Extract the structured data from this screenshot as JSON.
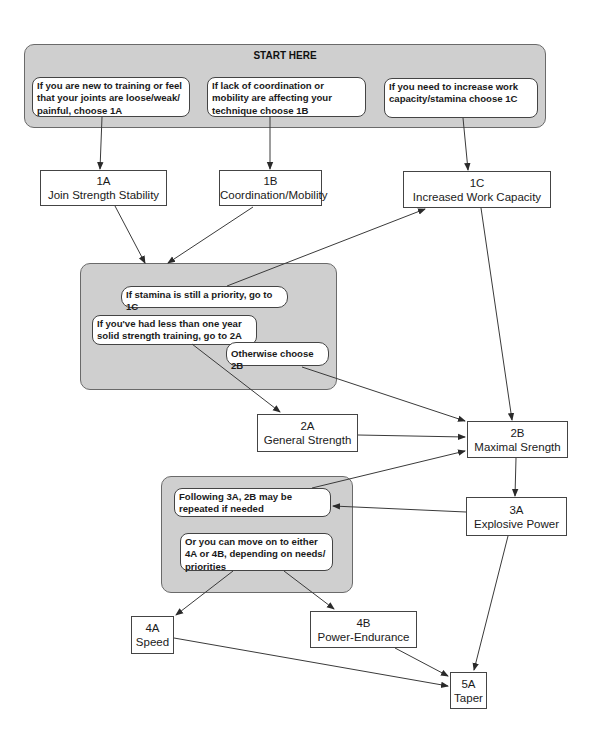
{
  "start_group": {
    "title": "START HERE",
    "notes": [
      {
        "text": "If you are new to training or feel that your joints are loose/weak/ painful, choose 1A"
      },
      {
        "text": "If lack of coordination or mobility are affecting your technique choose 1B"
      },
      {
        "text": "If you need to increase work capacity/stamina choose 1C"
      }
    ]
  },
  "nodes": {
    "n1a": {
      "code": "1A",
      "label": "Join Strength Stability"
    },
    "n1b": {
      "code": "1B",
      "label": "Coordination/Mobility"
    },
    "n1c": {
      "code": "1C",
      "label": "Increased Work Capacity"
    },
    "n2a": {
      "code": "2A",
      "label": "General Strength"
    },
    "n2b": {
      "code": "2B",
      "label": "Maximal Srength"
    },
    "n3a": {
      "code": "3A",
      "label": "Explosive Power"
    },
    "n4a": {
      "code": "4A",
      "label": "Speed"
    },
    "n4b": {
      "code": "4B",
      "label": "Power-Endurance"
    },
    "n5a": {
      "code": "5A",
      "label": "Taper"
    }
  },
  "phase1_group": {
    "notes": [
      {
        "text": "If stamina is still a priority, go to 1C"
      },
      {
        "text": "If you've had less than one year solid strength training, go to 2A"
      },
      {
        "text": "Otherwise choose 2B"
      }
    ]
  },
  "phase3_group": {
    "notes": [
      {
        "text": "Following 3A, 2B may be repeated if needed"
      },
      {
        "text": "Or you can move on to either 4A or 4B, depending on needs/ priorities"
      }
    ]
  },
  "colors": {
    "group_fill": "#cfcfcf",
    "stroke": "#444444",
    "background": "#ffffff"
  }
}
